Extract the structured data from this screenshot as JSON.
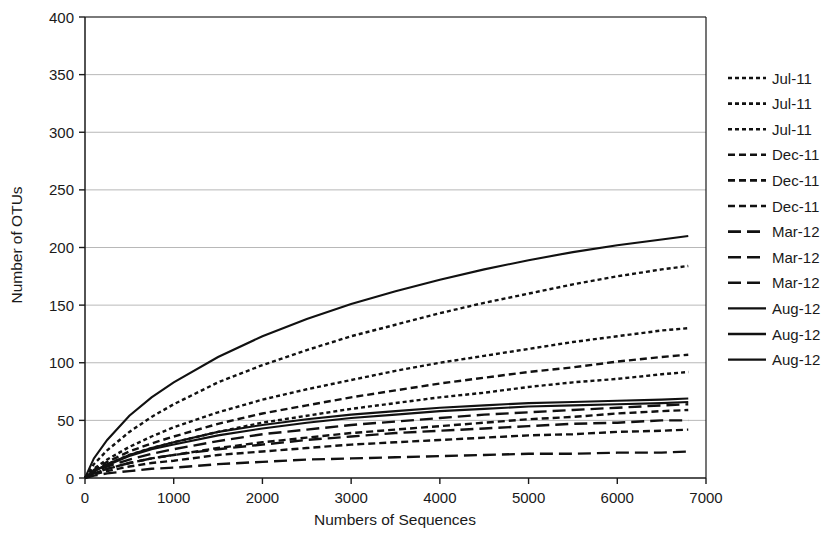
{
  "chart_data": {
    "type": "line",
    "title": "",
    "xlabel": "Numbers of Sequences",
    "ylabel": "Number of OTUs",
    "xlim": [
      0,
      7000
    ],
    "ylim": [
      0,
      400
    ],
    "xticks": [
      0,
      1000,
      2000,
      3000,
      4000,
      5000,
      6000,
      7000
    ],
    "yticks": [
      0,
      50,
      100,
      150,
      200,
      250,
      300,
      350,
      400
    ],
    "xtick_labels": [
      "0",
      "1000",
      "2000",
      "3000",
      "4000",
      "5000",
      "6000",
      "7000"
    ],
    "ytick_labels": [
      "0",
      "50",
      "100",
      "150",
      "200",
      "250",
      "300",
      "350",
      "400"
    ],
    "grid": "horizontal",
    "legend_position": "right",
    "x": [
      0,
      100,
      250,
      500,
      750,
      1000,
      1500,
      2000,
      2500,
      3000,
      3500,
      4000,
      4500,
      5000,
      5500,
      6000,
      6500,
      6800
    ],
    "series": [
      {
        "name": "Jul-11",
        "style": "dotted",
        "values": [
          0,
          12,
          24,
          40,
          53,
          64,
          83,
          98,
          111,
          123,
          133,
          143,
          152,
          160,
          168,
          175,
          181,
          184
        ]
      },
      {
        "name": "Jul-11",
        "style": "dotted",
        "values": [
          0,
          8,
          16,
          27,
          36,
          44,
          57,
          68,
          77,
          85,
          93,
          100,
          106,
          112,
          118,
          123,
          128,
          130
        ]
      },
      {
        "name": "Jul-11",
        "style": "dotted",
        "values": [
          0,
          6,
          12,
          20,
          26,
          31,
          40,
          48,
          54,
          60,
          65,
          70,
          74,
          79,
          83,
          86,
          90,
          92
        ]
      },
      {
        "name": "Dec-11",
        "style": "dashed-short",
        "values": [
          0,
          7,
          14,
          23,
          30,
          36,
          47,
          56,
          63,
          70,
          76,
          82,
          87,
          92,
          96,
          101,
          105,
          107
        ]
      },
      {
        "name": "Dec-11",
        "style": "dashed-short",
        "values": [
          0,
          4,
          8,
          13,
          17,
          20,
          26,
          31,
          35,
          39,
          42,
          45,
          48,
          51,
          53,
          56,
          58,
          59
        ]
      },
      {
        "name": "Dec-11",
        "style": "dashed-short",
        "values": [
          0,
          3,
          6,
          10,
          13,
          15,
          20,
          23,
          26,
          29,
          31,
          33,
          35,
          37,
          38,
          40,
          41,
          42
        ]
      },
      {
        "name": "Mar-12",
        "style": "dashed-long",
        "values": [
          0,
          5,
          10,
          16,
          21,
          25,
          32,
          38,
          42,
          46,
          49,
          52,
          55,
          57,
          59,
          61,
          63,
          64
        ]
      },
      {
        "name": "Mar-12",
        "style": "dashed-long",
        "values": [
          0,
          4,
          8,
          13,
          17,
          20,
          25,
          29,
          33,
          36,
          39,
          41,
          43,
          45,
          47,
          48,
          50,
          50
        ]
      },
      {
        "name": "Mar-12",
        "style": "dashed-long",
        "values": [
          0,
          2,
          4,
          6,
          8,
          9,
          12,
          14,
          16,
          17,
          18,
          19,
          20,
          21,
          21,
          22,
          22,
          23
        ]
      },
      {
        "name": "Aug-12",
        "style": "solid",
        "values": [
          0,
          17,
          33,
          54,
          70,
          83,
          105,
          123,
          138,
          151,
          162,
          172,
          181,
          189,
          196,
          202,
          207,
          210
        ]
      },
      {
        "name": "Aug-12",
        "style": "solid",
        "values": [
          0,
          6,
          12,
          20,
          26,
          31,
          40,
          46,
          51,
          55,
          58,
          61,
          63,
          65,
          66,
          67,
          68,
          69
        ]
      },
      {
        "name": "Aug-12",
        "style": "solid",
        "values": [
          0,
          6,
          11,
          19,
          25,
          29,
          37,
          43,
          48,
          52,
          55,
          58,
          60,
          62,
          63,
          64,
          65,
          66
        ]
      }
    ],
    "legend_entries": [
      {
        "label": "Jul-11",
        "style": "dotted"
      },
      {
        "label": "Jul-11",
        "style": "dotted"
      },
      {
        "label": "Jul-11",
        "style": "dotted"
      },
      {
        "label": "Dec-11",
        "style": "dashed-short"
      },
      {
        "label": "Dec-11",
        "style": "dashed-short"
      },
      {
        "label": "Dec-11",
        "style": "dashed-short"
      },
      {
        "label": "Mar-12",
        "style": "dashed-long"
      },
      {
        "label": "Mar-12",
        "style": "dashed-long"
      },
      {
        "label": "Mar-12",
        "style": "dashed-long"
      },
      {
        "label": "Aug-12",
        "style": "solid"
      },
      {
        "label": "Aug-12",
        "style": "solid"
      },
      {
        "label": "Aug-12",
        "style": "solid"
      }
    ],
    "line_color": "#111111",
    "grid_color": "#9a9a9a",
    "axis_color": "#1a1a1a"
  }
}
